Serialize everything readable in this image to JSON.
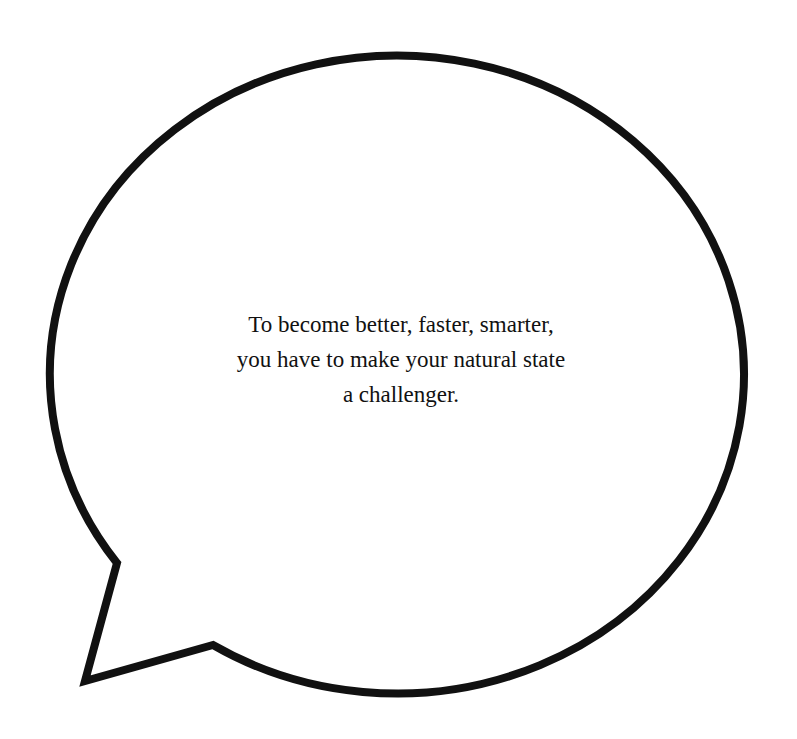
{
  "speech_bubble": {
    "stroke_color": "#111111",
    "fill_color": "#ffffff",
    "text_lines": [
      "To become better, faster, smarter,",
      "you have to make your natural state",
      "a challenger."
    ]
  }
}
